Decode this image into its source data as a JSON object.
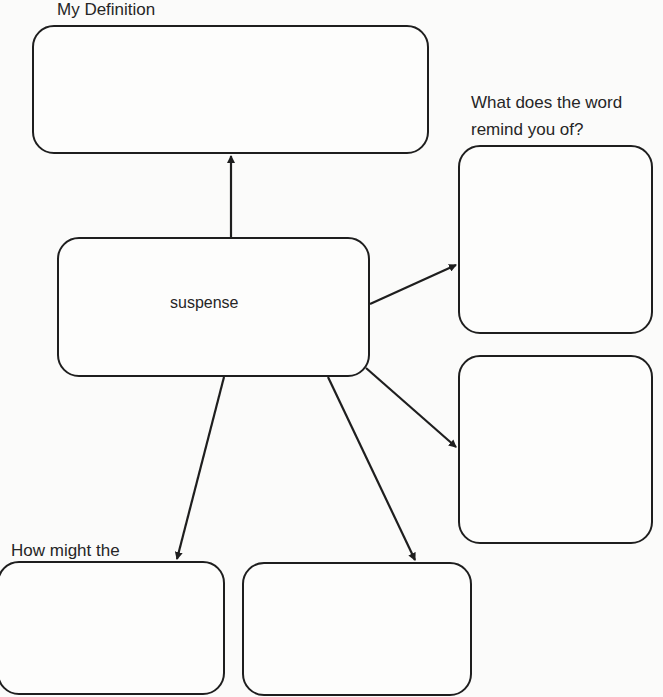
{
  "diagram": {
    "type": "word-map",
    "center_word": "suspense",
    "labels": {
      "definition": "My Definition",
      "remind_line1": "What does the word",
      "remind_line2": "remind you of?",
      "used_line1": "How might the",
      "used_line2": "word be used?"
    },
    "boxes": [
      {
        "id": "definition-box",
        "label": "My Definition",
        "content": ""
      },
      {
        "id": "center-box",
        "content": "suspense"
      },
      {
        "id": "remind-box",
        "label": "What does the word remind you of?",
        "content": ""
      },
      {
        "id": "right-middle-box",
        "content": ""
      },
      {
        "id": "usage-box",
        "label": "How might the word be used?",
        "content": ""
      },
      {
        "id": "bottom-middle-box",
        "content": ""
      }
    ],
    "colors": {
      "stroke": "#1e1e1e",
      "background": "#fbfbfa"
    }
  }
}
